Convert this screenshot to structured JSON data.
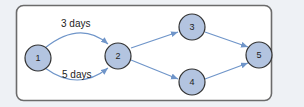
{
  "colors": {
    "background": "#eef1f5",
    "panel_fill": "#ffffff",
    "panel_border": "#6b6b6b",
    "node_fill": "#b3c4e0",
    "node_stroke": "#333333",
    "edge": "#6f95c9",
    "text": "#222222"
  },
  "nodes": [
    {
      "id": "1",
      "label": "1"
    },
    {
      "id": "2",
      "label": "2"
    },
    {
      "id": "3",
      "label": "3"
    },
    {
      "id": "4",
      "label": "4"
    },
    {
      "id": "5",
      "label": "5"
    }
  ],
  "edges": [
    {
      "from": "1",
      "to": "2",
      "label": "3 days"
    },
    {
      "from": "1",
      "to": "2",
      "label": "5 days"
    },
    {
      "from": "2",
      "to": "3",
      "label": ""
    },
    {
      "from": "2",
      "to": "4",
      "label": ""
    },
    {
      "from": "3",
      "to": "5",
      "label": ""
    },
    {
      "from": "4",
      "to": "5",
      "label": ""
    }
  ]
}
